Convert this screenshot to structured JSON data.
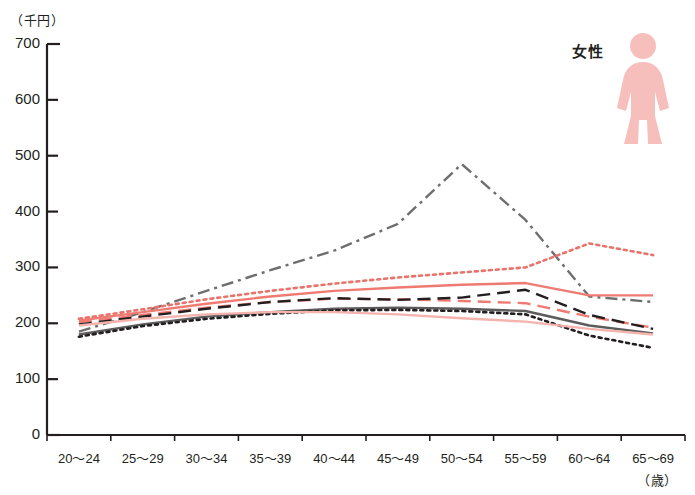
{
  "chart_data": {
    "type": "line",
    "title": "",
    "subtitle": "",
    "xlabel": "（歳）",
    "ylabel": "（千円）",
    "ylim": [
      0,
      700
    ],
    "ytick_step": 100,
    "yticks": [
      "0",
      "100",
      "200",
      "300",
      "400",
      "500",
      "600",
      "700"
    ],
    "grid": false,
    "legend_position": "none",
    "categories": [
      "20～24",
      "25～29",
      "30～34",
      "35～39",
      "40～44",
      "45～49",
      "50～54",
      "55～59",
      "60～64",
      "65～69"
    ],
    "series": [
      {
        "name": "gray-dashdot-peak",
        "style": "dash-dot",
        "color": "#6e6e6e",
        "values": [
          185,
          220,
          258,
          295,
          330,
          378,
          485,
          385,
          248,
          238
        ]
      },
      {
        "name": "red-dotted",
        "style": "dotted",
        "color": "#e8736b",
        "values": [
          208,
          225,
          243,
          258,
          271,
          282,
          291,
          300,
          343,
          322
        ]
      },
      {
        "name": "red-solid",
        "style": "solid",
        "color": "#ef7a72",
        "values": [
          205,
          220,
          235,
          248,
          258,
          264,
          269,
          272,
          250,
          250
        ]
      },
      {
        "name": "red-dashed",
        "style": "dashed",
        "color": "#ef7a72",
        "values": [
          202,
          215,
          228,
          238,
          244,
          243,
          240,
          236,
          212,
          192
        ]
      },
      {
        "name": "black-dashed",
        "style": "dashed",
        "color": "#231f20",
        "values": [
          198,
          212,
          226,
          238,
          245,
          242,
          246,
          260,
          215,
          190
        ]
      },
      {
        "name": "gray-solid",
        "style": "solid",
        "color": "#5c5c5c",
        "values": [
          180,
          198,
          212,
          220,
          226,
          228,
          226,
          222,
          196,
          182
        ]
      },
      {
        "name": "black-dotted",
        "style": "dotted",
        "color": "#231f20",
        "values": [
          176,
          195,
          208,
          217,
          223,
          224,
          222,
          216,
          178,
          156
        ]
      },
      {
        "name": "pink-solid",
        "style": "solid",
        "color": "#f5b3ae",
        "values": [
          196,
          208,
          216,
          220,
          220,
          216,
          209,
          203,
          190,
          180
        ]
      }
    ]
  },
  "annotations": {
    "gender_label": "女性",
    "gender_icon": "female-figure-icon",
    "gender_icon_color": "#f7bfbb"
  },
  "axes": {
    "y_unit": "（千円）",
    "x_unit": "（歳）",
    "axis_color": "#231f20"
  }
}
